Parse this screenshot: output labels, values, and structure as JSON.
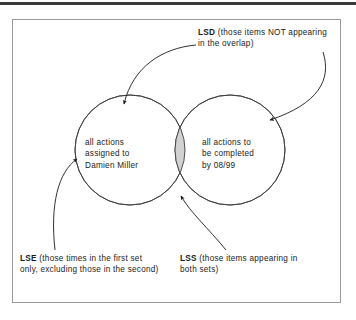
{
  "figure": {
    "type": "venn-diagram",
    "frame": {
      "border_color": "#9a9a9a"
    },
    "top_rule_color": "#3a3a3a",
    "sets": {
      "left": {
        "name": "left-set",
        "text": "all actions\nassigned to\nDamien Miller",
        "fill": "#ffffff",
        "stroke": "#3c3c3c"
      },
      "right": {
        "name": "right-set",
        "text": "all actions to\nbe completed\nby 08/99",
        "fill": "#ffffff",
        "stroke": "#3c3c3c"
      },
      "overlap": {
        "name": "overlap-lens",
        "fill": "#d2d2d2",
        "stroke": "#3c3c3c"
      }
    },
    "callouts": {
      "lsd": {
        "code": "LSD",
        "description": " (those items NOT appearing in the overlap)"
      },
      "lse": {
        "code": "LSE",
        "description": " (those times in the first set only, excluding those in the second)"
      },
      "lss": {
        "code": "LSS",
        "description": " (those items appearing in both sets)"
      }
    }
  }
}
